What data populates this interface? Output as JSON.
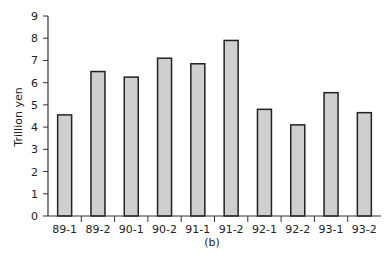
{
  "chart_data": {
    "type": "bar",
    "title": "",
    "caption": "(b)",
    "xlabel": "",
    "ylabel": "Trillion yen",
    "ylim": [
      0,
      9
    ],
    "yticks": [
      0,
      1,
      2,
      3,
      4,
      5,
      6,
      7,
      8,
      9
    ],
    "grid": false,
    "legend": null,
    "categories": [
      "89-1",
      "89-2",
      "90-1",
      "90-2",
      "91-1",
      "91-2",
      "92-1",
      "92-2",
      "93-1",
      "93-2"
    ],
    "values": [
      4.55,
      6.5,
      6.25,
      7.1,
      6.85,
      7.9,
      4.8,
      4.1,
      5.55,
      4.65
    ],
    "colors": {
      "bar_fill": "#cfcfcf",
      "bar_stroke": "#222222",
      "axis": "#333333"
    }
  }
}
